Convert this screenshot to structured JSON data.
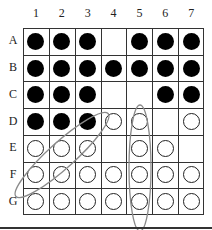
{
  "columns": [
    "1",
    "2",
    "3",
    "4",
    "5",
    "6",
    "7"
  ],
  "rows": [
    "A",
    "B",
    "C",
    "D",
    "E",
    "F",
    "G"
  ],
  "board": [
    [
      "B",
      "B",
      "B",
      "",
      "B",
      "B",
      "B"
    ],
    [
      "B",
      "B",
      "B",
      "B",
      "B",
      "B",
      "B"
    ],
    [
      "B",
      "B",
      "B",
      "",
      "",
      "B",
      "B"
    ],
    [
      "B",
      "B",
      "B",
      "W",
      "W",
      "",
      "W"
    ],
    [
      "W",
      "W",
      "W",
      "",
      "W",
      "W",
      ""
    ],
    [
      "W",
      "W",
      "W",
      "W",
      "W",
      "W",
      "W"
    ],
    [
      "W",
      "W",
      "W",
      "W",
      "W",
      "W",
      "W"
    ]
  ],
  "annotations": [
    {
      "type": "ellipse",
      "description": "diagonal ellipse from G1 to D4",
      "color": "#888888"
    },
    {
      "type": "ellipse",
      "description": "vertical ellipse over column 5 rows D to G",
      "color": "#888888"
    }
  ],
  "colors": {
    "stone_black": "#000000",
    "stone_white": "#ffffff",
    "grid": "#333333",
    "annotation": "#888888"
  }
}
